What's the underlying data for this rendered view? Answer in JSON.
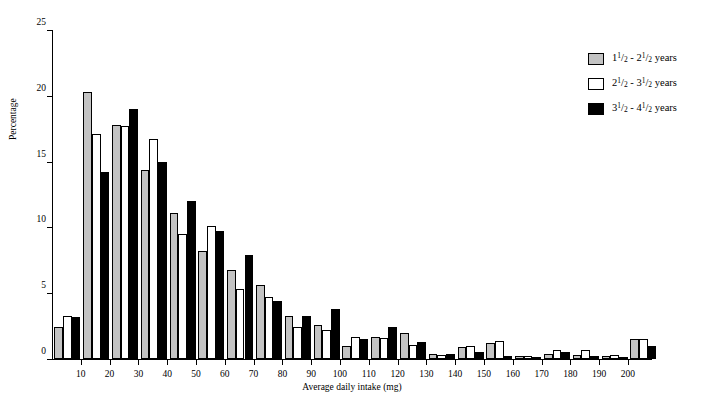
{
  "caption": "",
  "chart_data": {
    "type": "bar",
    "title": "",
    "xlabel": "Average daily intake (mg)",
    "ylabel": "Percentage",
    "ylim": [
      0,
      25
    ],
    "ytick_values": [
      0,
      5,
      10,
      15,
      20,
      25
    ],
    "ytick_labels": [
      "0",
      "5",
      "10",
      "15",
      "20",
      "25"
    ],
    "xtick_values": [
      10,
      20,
      30,
      40,
      50,
      60,
      70,
      80,
      90,
      100,
      110,
      120,
      130,
      140,
      150,
      160,
      170,
      180,
      190,
      200
    ],
    "xtick_labels": [
      "10",
      "20",
      "30",
      "40",
      "50",
      "60",
      "70",
      "80",
      "90",
      "100",
      "110",
      "120",
      "130",
      "140",
      "150",
      "160",
      "170",
      "180",
      "190",
      "200"
    ],
    "xlim": [
      0,
      208
    ],
    "grid": false,
    "legend_position": "right",
    "categories": [
      5,
      15,
      25,
      35,
      45,
      55,
      65,
      75,
      85,
      95,
      105,
      115,
      125,
      135,
      145,
      155,
      165,
      175,
      185,
      195,
      205
    ],
    "series": [
      {
        "name": "1 1/2 - 2 1/2 years",
        "color": "#c3c3c3",
        "legend_numer1": "1",
        "legend_denom1": "2",
        "legend_whole1": "1",
        "legend_numer2": "1",
        "legend_denom2": "2",
        "legend_whole2": "2",
        "legend_suffix": "years",
        "values": [
          2.4,
          20.3,
          17.8,
          14.4,
          11.1,
          8.2,
          6.8,
          5.6,
          3.3,
          2.6,
          1.0,
          1.7,
          2.0,
          0.4,
          0.9,
          1.2,
          0.2,
          0.4,
          0.3,
          0.2,
          1.5
        ]
      },
      {
        "name": "2 1/2 - 3 1/2 years",
        "color": "#ffffff",
        "legend_numer1": "1",
        "legend_denom1": "2",
        "legend_whole1": "2",
        "legend_numer2": "1",
        "legend_denom2": "2",
        "legend_whole2": "3",
        "legend_suffix": "years",
        "values": [
          3.3,
          17.1,
          17.7,
          16.7,
          9.5,
          10.1,
          5.3,
          4.7,
          2.4,
          2.2,
          1.7,
          1.6,
          1.1,
          0.3,
          1.0,
          1.4,
          0.2,
          0.7,
          0.7,
          0.3,
          1.5
        ]
      },
      {
        "name": "3 1/2 - 4 1/2 years",
        "color": "#000000",
        "legend_numer1": "1",
        "legend_denom1": "2",
        "legend_whole1": "3",
        "legend_numer2": "1",
        "legend_denom2": "2",
        "legend_whole2": "4",
        "legend_suffix": "years",
        "values": [
          3.2,
          14.2,
          19.0,
          15.0,
          12.0,
          9.7,
          7.9,
          4.4,
          3.3,
          3.8,
          1.5,
          2.4,
          1.3,
          0.4,
          0.5,
          0.2,
          0.1,
          0.5,
          0.2,
          0.1,
          1.0
        ]
      }
    ]
  }
}
